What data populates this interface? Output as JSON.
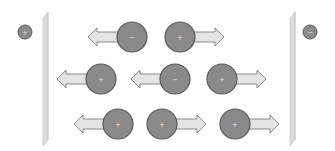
{
  "diagram": {
    "colors": {
      "ion_fill": "#8a8a8a",
      "ion_stroke": "#5a5a5a",
      "ion_sign": "#e6e6e6",
      "arrow_fill": "#e4e4e4",
      "arrow_stroke": "#8a8a8a",
      "plate_fill": "#dcdcdc",
      "plate_edge": "#c4c4c4"
    },
    "electrodes": [
      {
        "id": "left",
        "sign": "+",
        "label_x": 25,
        "label_y": 32,
        "plate_x": 43
      },
      {
        "id": "right",
        "sign": "−",
        "label_x": 310,
        "label_y": 32,
        "plate_x": 290
      }
    ],
    "ions": [
      {
        "row": 1,
        "sign": "−",
        "cx": 132,
        "cy": 37,
        "direction": "left"
      },
      {
        "row": 1,
        "sign": "+",
        "cx": 180,
        "cy": 37,
        "direction": "right"
      },
      {
        "row": 2,
        "sign": "+",
        "cx": 101,
        "cy": 79,
        "direction": "left"
      },
      {
        "row": 2,
        "sign": "−",
        "cx": 175,
        "cy": 79,
        "direction": "left"
      },
      {
        "row": 2,
        "sign": "+",
        "cx": 222,
        "cy": 79,
        "direction": "right"
      },
      {
        "row": 3,
        "sign": "+",
        "cx": 118,
        "cy": 124,
        "direction": "left"
      },
      {
        "row": 3,
        "sign": "+",
        "cx": 162,
        "cy": 124,
        "direction": "right"
      },
      {
        "row": 3,
        "sign": "+",
        "cx": 235,
        "cy": 124,
        "direction": "right"
      }
    ]
  }
}
